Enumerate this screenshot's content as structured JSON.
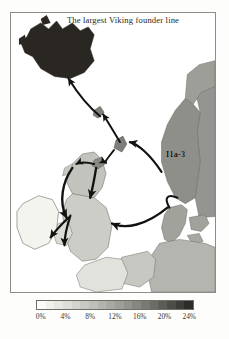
{
  "figure": {
    "title": "The largest Viking founder line",
    "type": "choropleth-map-with-migration-arrows",
    "region": "North Atlantic and Northwest Europe"
  },
  "map": {
    "haplogroup_label": "I1a-3",
    "frame_border_color": "#8d8d88",
    "ocean_color": "#ffffff",
    "coastline_color": "#6b6b66",
    "arrow_color": "#141210",
    "regions": [
      {
        "name": "Iceland",
        "frequency_pct": 24,
        "fill": "#2a2622"
      },
      {
        "name": "Norway",
        "frequency_pct": 19,
        "fill": "#8f8f8a"
      },
      {
        "name": "Northern Norway",
        "frequency_pct": 16,
        "fill": "#9e9e99"
      },
      {
        "name": "Denmark",
        "frequency_pct": 15,
        "fill": "#a2a29c"
      },
      {
        "name": "Sweden",
        "frequency_pct": 17,
        "fill": "#949490"
      },
      {
        "name": "Shetland",
        "frequency_pct": 20,
        "fill": "#7e7e79"
      },
      {
        "name": "Orkney",
        "frequency_pct": 18,
        "fill": "#8a8a85"
      },
      {
        "name": "Faroe Islands",
        "frequency_pct": 20,
        "fill": "#80807b"
      },
      {
        "name": "Scotland",
        "frequency_pct": 9,
        "fill": "#c3c3bd"
      },
      {
        "name": "England",
        "frequency_pct": 7,
        "fill": "#cdcdc7"
      },
      {
        "name": "Wales",
        "frequency_pct": 5,
        "fill": "#dcdcd6"
      },
      {
        "name": "Ireland",
        "frequency_pct": 1,
        "fill": "#f4f4ef"
      },
      {
        "name": "Northern France",
        "frequency_pct": 4,
        "fill": "#e2e2dc"
      },
      {
        "name": "Low Countries",
        "frequency_pct": 8,
        "fill": "#c8c8c2"
      },
      {
        "name": "Northern Germany",
        "frequency_pct": 11,
        "fill": "#b5b5af"
      }
    ],
    "arrows": [
      {
        "name": "norway-to-iceland",
        "from": "Norway",
        "to": "Iceland"
      },
      {
        "name": "norway-to-faroes",
        "from": "Norway",
        "to": "Faroe Islands"
      },
      {
        "name": "norway-to-shetland",
        "from": "Norway",
        "to": "Shetland"
      },
      {
        "name": "shetland-to-orkney",
        "from": "Shetland",
        "to": "Orkney"
      },
      {
        "name": "orkney-to-scotland",
        "from": "Orkney",
        "to": "Scotland"
      },
      {
        "name": "scotland-to-ireland",
        "from": "Scotland",
        "to": "Ireland"
      },
      {
        "name": "denmark-to-england",
        "from": "Denmark",
        "to": "England"
      }
    ]
  },
  "legend": {
    "title": "",
    "unit": "%",
    "ticks": [
      "0%",
      "4%",
      "8%",
      "12%",
      "16%",
      "20%",
      "24%"
    ],
    "swatches": [
      "#fbfbf7",
      "#f2f2ed",
      "#e8e8e2",
      "#deded8",
      "#d4d4ce",
      "#c9c9c3",
      "#bfbfb9",
      "#b4b4ae",
      "#a9a9a3",
      "#9e9e98",
      "#93938d",
      "#878781",
      "#7a7a74",
      "#6c6c66",
      "#5d5d58",
      "#4d4d48",
      "#3c3c38",
      "#2b2b27"
    ]
  },
  "chart_data": {
    "type": "heatmap",
    "title": "The largest Viking founder line",
    "xlabel": "",
    "ylabel": "",
    "categories": [
      "Iceland",
      "Norway",
      "Northern Norway",
      "Denmark",
      "Sweden",
      "Shetland",
      "Orkney",
      "Faroe Islands",
      "Scotland",
      "England",
      "Wales",
      "Ireland",
      "Northern France",
      "Low Countries",
      "Northern Germany"
    ],
    "values": [
      24,
      19,
      16,
      15,
      17,
      20,
      18,
      20,
      9,
      7,
      5,
      1,
      4,
      8,
      11
    ],
    "series": [
      {
        "name": "I1a-3 frequency (%)",
        "values": [
          24,
          19,
          16,
          15,
          17,
          20,
          18,
          20,
          9,
          7,
          5,
          1,
          4,
          8,
          11
        ]
      }
    ],
    "ylim": [
      0,
      24
    ],
    "colorbar_ticks": [
      0,
      4,
      8,
      12,
      16,
      20,
      24
    ],
    "colorbar_label": "%",
    "legend_position": "bottom",
    "grid": false,
    "annotations": [
      "I1a-3"
    ]
  }
}
